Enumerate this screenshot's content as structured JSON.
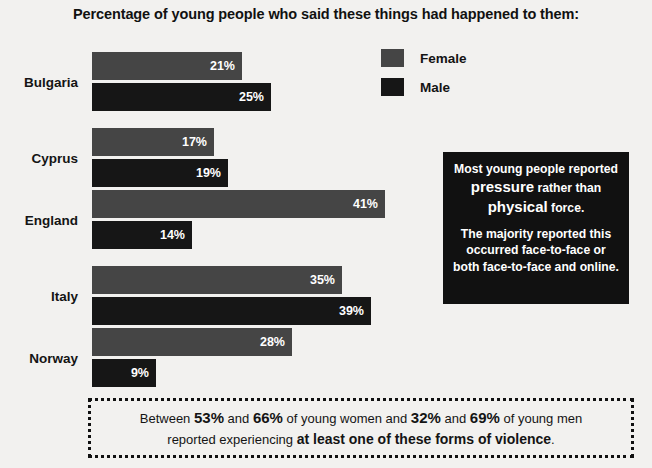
{
  "title": "Percentage of young people who said these things had happened to them:",
  "legend": {
    "items": [
      {
        "label": "Female",
        "color": "#454545",
        "swatch_icon": "legend-swatch-icon"
      },
      {
        "label": "Male",
        "color": "#161616",
        "swatch_icon": "legend-swatch-icon"
      }
    ]
  },
  "callout": {
    "paragraph1_part1": "Most young people reported ",
    "paragraph1_emph1": "pressure",
    "paragraph1_part2": " rather than ",
    "paragraph1_emph2": "physical",
    "paragraph1_part3": " force.",
    "paragraph2": "The majority reported this occurred face-to-face or both face-to-face and online."
  },
  "banner": {
    "line1_a": "Between ",
    "line1_n1": "53%",
    "line1_b": " and ",
    "line1_n2": "66%",
    "line1_c": " of young women and ",
    "line1_n3": "32%",
    "line1_d": " and ",
    "line1_n4": "69%",
    "line1_e": " of young men",
    "line2_a": "reported experiencing ",
    "line2_strong": "at least one of these forms of violence",
    "line2_b": "."
  },
  "chart_data": {
    "type": "bar",
    "orientation": "horizontal",
    "title": "Percentage of young people who said these things had happened to them:",
    "xlabel": "",
    "ylabel": "",
    "xlim": [
      0,
      41
    ],
    "grid": false,
    "legend_position": "top-right",
    "categories": [
      "Bulgaria",
      "Cyprus",
      "England",
      "Italy",
      "Norway"
    ],
    "series": [
      {
        "name": "Female",
        "color": "#454545",
        "values": [
          21,
          17,
          41,
          35,
          28
        ],
        "labels": [
          "21%",
          "17%",
          "41%",
          "35%",
          "28%"
        ]
      },
      {
        "name": "Male",
        "color": "#161616",
        "values": [
          25,
          19,
          14,
          39,
          9
        ],
        "labels": [
          "25%",
          "19%",
          "14%",
          "39%",
          "9%"
        ]
      }
    ],
    "px_per_percent": 7.15,
    "bar_origin_x": 92
  }
}
